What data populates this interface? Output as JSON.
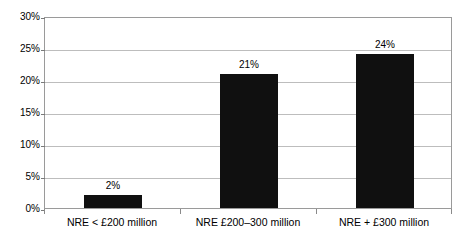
{
  "chart_data": {
    "type": "bar",
    "title": "",
    "subtitle": "",
    "xlabel": "",
    "ylabel": "",
    "categories": [
      "NRE < £200 million",
      "NRE £200–300 million",
      "NRE + £300 million"
    ],
    "values": [
      2,
      21,
      24
    ],
    "value_labels": [
      "2%",
      "21%",
      "24%"
    ],
    "ylim": [
      0,
      30
    ],
    "ytick_values": [
      0,
      5,
      10,
      15,
      20,
      25,
      30
    ],
    "ytick_labels": [
      "0%",
      "5%",
      "10%",
      "15%",
      "20%",
      "25%",
      "30%"
    ],
    "grid": true,
    "grid_axis": "y",
    "legend": false,
    "legend_position": "none",
    "series_color": "#101010",
    "gridline_color": "#bdbdbd",
    "frame_color": "#9a9a9a",
    "background_color": "#ffffff"
  }
}
